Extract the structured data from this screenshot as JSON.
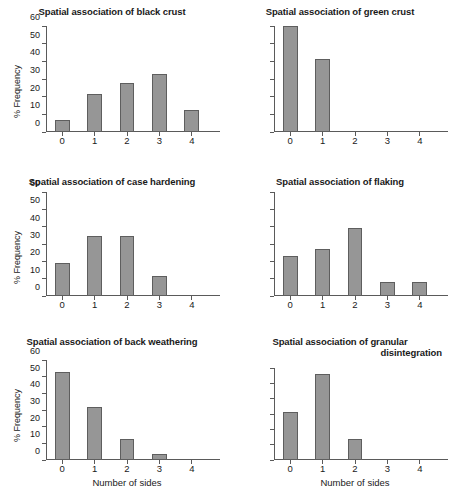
{
  "figure": {
    "axis_title_y": "% Frequency",
    "axis_title_x": "Number of sides",
    "bar_color": "#969696",
    "bar_border_color": "#5e5e5e",
    "axis_color": "#5a5a5a"
  },
  "chart_data": [
    {
      "type": "bar",
      "title": "Spatial association of black crust",
      "categories": [
        "0",
        "1",
        "2",
        "3",
        "4"
      ],
      "values": [
        7,
        21.5,
        27.5,
        33,
        12.5
      ],
      "xlabel": "",
      "ylabel": "% Frequency",
      "ylim": [
        0,
        60
      ],
      "yticks": [
        0,
        10,
        20,
        30,
        40,
        50,
        60
      ],
      "ytick_labels": [
        "0",
        "10",
        "20",
        "30",
        "40",
        "50",
        "60"
      ],
      "show_ytick_labels": true,
      "show_xlabel": false,
      "grid": false,
      "legend": "none"
    },
    {
      "type": "bar",
      "title": "Spatial association of green crust",
      "categories": [
        "0",
        "1",
        "2",
        "3",
        "4"
      ],
      "values": [
        60,
        41.5,
        0,
        0,
        0
      ],
      "xlabel": "",
      "ylabel": "",
      "ylim": [
        0,
        60
      ],
      "yticks": [
        0,
        10,
        20,
        30,
        40,
        50,
        60
      ],
      "ytick_labels": [
        "",
        "",
        "",
        "",
        "",
        "",
        ""
      ],
      "show_ytick_labels": false,
      "show_xlabel": false,
      "grid": false,
      "legend": "none"
    },
    {
      "type": "bar",
      "title": "Spatial association of case hardening",
      "categories": [
        "0",
        "1",
        "2",
        "3",
        "4"
      ],
      "values": [
        19,
        34.5,
        34.5,
        11.5,
        0
      ],
      "xlabel": "",
      "ylabel": "% Frequency",
      "ylim": [
        0,
        60
      ],
      "yticks": [
        0,
        10,
        20,
        30,
        40,
        50,
        60
      ],
      "ytick_labels": [
        "0",
        "10",
        "20",
        "30",
        "40",
        "50",
        "60"
      ],
      "show_ytick_labels": true,
      "show_xlabel": false,
      "grid": false,
      "legend": "none"
    },
    {
      "type": "bar",
      "title": "Spatial association of flaking",
      "categories": [
        "0",
        "1",
        "2",
        "3",
        "4"
      ],
      "values": [
        23,
        27,
        39,
        8,
        8
      ],
      "xlabel": "",
      "ylabel": "",
      "ylim": [
        0,
        60
      ],
      "yticks": [
        0,
        10,
        20,
        30,
        40,
        50,
        60
      ],
      "ytick_labels": [
        "",
        "",
        "",
        "",
        "",
        "",
        ""
      ],
      "show_ytick_labels": false,
      "show_xlabel": false,
      "grid": false,
      "legend": "none"
    },
    {
      "type": "bar",
      "title": "Spatial association of back weathering",
      "categories": [
        "0",
        "1",
        "2",
        "3",
        "4"
      ],
      "values": [
        53,
        32,
        12.5,
        3.5,
        0
      ],
      "xlabel": "Number of sides",
      "ylabel": "% Frequency",
      "ylim": [
        0,
        60
      ],
      "yticks": [
        0,
        10,
        20,
        30,
        40,
        50,
        60
      ],
      "ytick_labels": [
        "0",
        "10",
        "20",
        "30",
        "40",
        "50",
        "60"
      ],
      "show_ytick_labels": true,
      "show_xlabel": true,
      "grid": false,
      "legend": "none"
    },
    {
      "type": "bar",
      "title": "Spatial association of granular disintegration",
      "title_line1": "Spatial association of granular",
      "title_line2": "disintegration",
      "categories": [
        "0",
        "1",
        "2",
        "3",
        "4"
      ],
      "values": [
        31.5,
        56,
        13.5,
        0,
        0
      ],
      "xlabel": "Number of sides",
      "ylabel": "",
      "ylim": [
        0,
        60
      ],
      "yticks": [
        0,
        10,
        20,
        30,
        40,
        50,
        60
      ],
      "ytick_labels": [
        "",
        "",
        "",
        "",
        "",
        "",
        ""
      ],
      "show_ytick_labels": false,
      "show_xlabel": true,
      "grid": false,
      "legend": "none"
    }
  ]
}
